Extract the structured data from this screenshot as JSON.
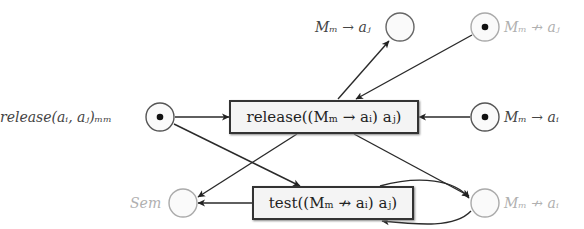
{
  "diagram": {
    "type": "petri-net",
    "places": [
      {
        "id": "p_release_in",
        "label": "release(a_i, a_j)_{M_m}",
        "label_text": "release(aᵢ, aⱼ)ₘₘ",
        "marked": true,
        "style": "dark"
      },
      {
        "id": "p_top_mid",
        "label_text": "Mₘ → aⱼ",
        "marked": false,
        "style": "dark"
      },
      {
        "id": "p_top_right",
        "label_text": "Mₘ ↛ aⱼ",
        "marked": true,
        "style": "light"
      },
      {
        "id": "p_mid_right",
        "label_text": "Mₘ → aᵢ",
        "marked": true,
        "style": "dark"
      },
      {
        "id": "p_sem",
        "label_text": "Sem",
        "marked": false,
        "style": "light"
      },
      {
        "id": "p_bottom_right",
        "label_text": "Mₘ ↛ aᵢ",
        "marked": false,
        "style": "light"
      }
    ],
    "transitions": [
      {
        "id": "t_release",
        "label_text": "release((Mₘ → aᵢ) aⱼ)"
      },
      {
        "id": "t_test",
        "label_text": "test((Mₘ ↛ aᵢ) aⱼ)"
      }
    ],
    "arcs": [
      {
        "from": "p_release_in",
        "to": "t_release"
      },
      {
        "from": "p_release_in",
        "to": "t_test"
      },
      {
        "from": "t_release",
        "to": "p_top_mid"
      },
      {
        "from": "p_top_right",
        "to": "t_release"
      },
      {
        "from": "p_mid_right",
        "to": "t_release"
      },
      {
        "from": "t_release",
        "to": "p_sem"
      },
      {
        "from": "t_release",
        "to": "p_bottom_right"
      },
      {
        "from": "t_test",
        "to": "p_sem"
      },
      {
        "from": "t_test",
        "to": "p_bottom_right"
      },
      {
        "from": "p_bottom_right",
        "to": "t_test"
      }
    ]
  }
}
